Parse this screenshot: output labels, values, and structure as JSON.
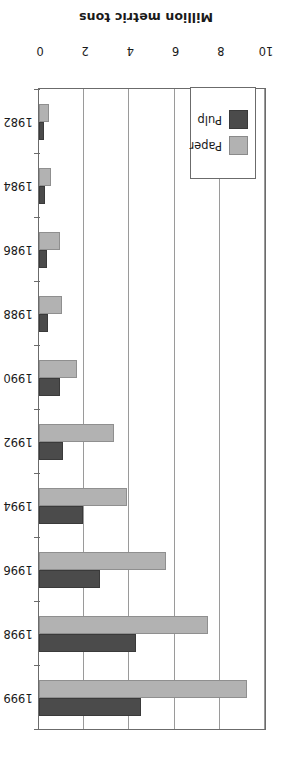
{
  "chart_data": {
    "type": "bar",
    "orientation": "horizontal",
    "title": "",
    "subtitle": "",
    "xlabel": "Million metric tons",
    "ylabel": "",
    "xlim": [
      0,
      10
    ],
    "xticks": [
      0,
      2,
      4,
      6,
      8,
      10
    ],
    "xtick_labels": [
      "0",
      "2",
      "4",
      "6",
      "8",
      "10"
    ],
    "grid": true,
    "grid_axis": "x",
    "legend_position": "bottom-left",
    "categories": [
      "1982",
      "1984",
      "1986",
      "1988",
      "1990",
      "1992",
      "1994",
      "1996",
      "1998",
      "1999"
    ],
    "series": [
      {
        "name": "Paper",
        "color": "#b2b2b2",
        "values": [
          0.45,
          0.55,
          0.95,
          1.0,
          1.7,
          3.3,
          3.9,
          5.6,
          7.5,
          9.2
        ]
      },
      {
        "name": "Pulp",
        "color": "#4b4b4b",
        "values": [
          0.2,
          0.25,
          0.35,
          0.4,
          0.95,
          1.05,
          1.95,
          2.7,
          4.3,
          4.5
        ]
      }
    ]
  },
  "axis": {
    "value_axis_title": "Million metric tons"
  },
  "legend": {
    "entries": [
      {
        "label": "Paper",
        "swatch": "paper-swatch"
      },
      {
        "label": "Pulp",
        "swatch": "pulp-swatch"
      }
    ]
  },
  "colors": {
    "paper": "#b2b2b2",
    "pulp": "#4b4b4b",
    "frame": "#6b6b6b",
    "grid": "#9a9a9a",
    "text": "#1a1a1a",
    "background": "#ffffff"
  }
}
